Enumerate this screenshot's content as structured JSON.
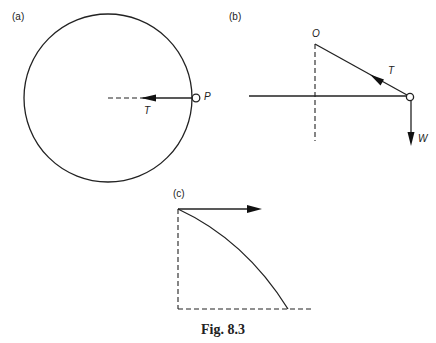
{
  "figure": {
    "caption": "Fig. 8.3",
    "panels": {
      "a": {
        "label": "(a)",
        "point_label": "P",
        "force_label": "T",
        "description": "Circular path with particle P on the circle; tension T acts toward the centre"
      },
      "b": {
        "label": "(b)",
        "pivot_label": "O",
        "tension_label": "T",
        "weight_label": "W",
        "description": "Side view: string from O to particle with tension T along string and weight W downward"
      },
      "c": {
        "label": "(c)",
        "description": "Horizontal velocity arrow with curved trajectory bounded by dashed vertical and horizontal lines"
      }
    }
  }
}
